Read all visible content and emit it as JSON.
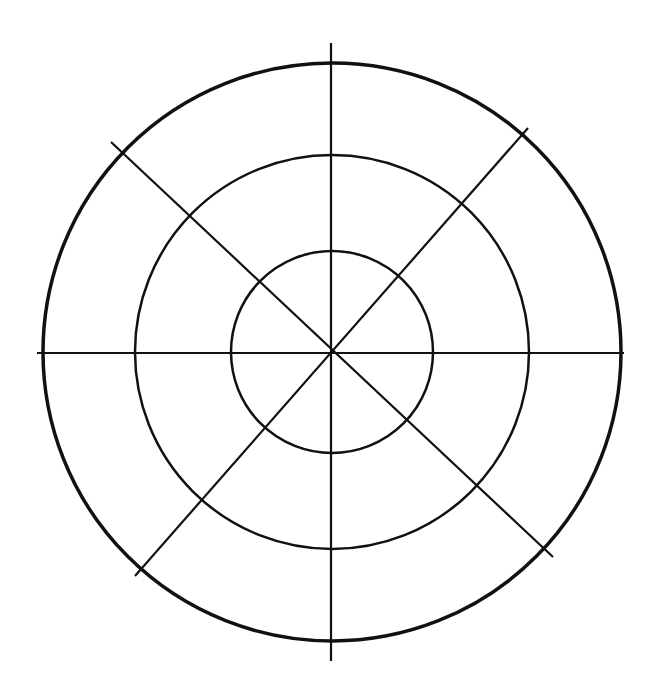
{
  "diagram": {
    "type": "polar-grid",
    "background": "#ffffff",
    "stroke_color": "#111111",
    "center": {
      "x": 332,
      "y": 352
    },
    "rings": [
      {
        "name": "outer-ring",
        "r": 289,
        "stroke_width": 3.5
      },
      {
        "name": "middle-ring",
        "r": 197,
        "stroke_width": 2.5
      },
      {
        "name": "inner-ring",
        "r": 101,
        "stroke_width": 2.5
      }
    ],
    "spokes": [
      {
        "name": "vertical-axis",
        "x1": 331,
        "y1": 43,
        "x2": 331,
        "y2": 661
      },
      {
        "name": "horizontal-axis",
        "x1": 37,
        "y1": 353,
        "x2": 624,
        "y2": 353
      },
      {
        "name": "diagonal-nw-se",
        "x1": 111,
        "y1": 142,
        "x2": 553,
        "y2": 557
      },
      {
        "name": "diagonal-ne-sw",
        "x1": 528,
        "y1": 128,
        "x2": 135,
        "y2": 576
      }
    ],
    "spoke_stroke_width": 2.2
  }
}
